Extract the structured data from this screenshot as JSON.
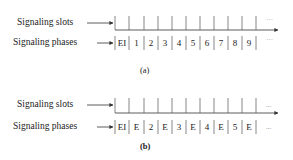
{
  "figure_a": {
    "caption": "(a)",
    "slots_label": "Signaling slots",
    "phases_label": "Signaling phases",
    "phases": [
      "EI",
      "1",
      "2",
      "3",
      "4",
      "5",
      "6",
      "7",
      "8",
      "9"
    ],
    "slots_ellipsis": "···",
    "phases_ellipsis": "···"
  },
  "figure_b": {
    "caption": "(b)",
    "slots_label": "Signaling slots",
    "phases_label": "Signaling phases",
    "phases": [
      "EI",
      "E",
      "2",
      "E",
      "3",
      "E",
      "4",
      "E",
      "5",
      "E"
    ],
    "slots_ellipsis": "...",
    "phases_ellipsis": "..."
  },
  "colors": {
    "line": "#333333",
    "text": "#222222"
  }
}
